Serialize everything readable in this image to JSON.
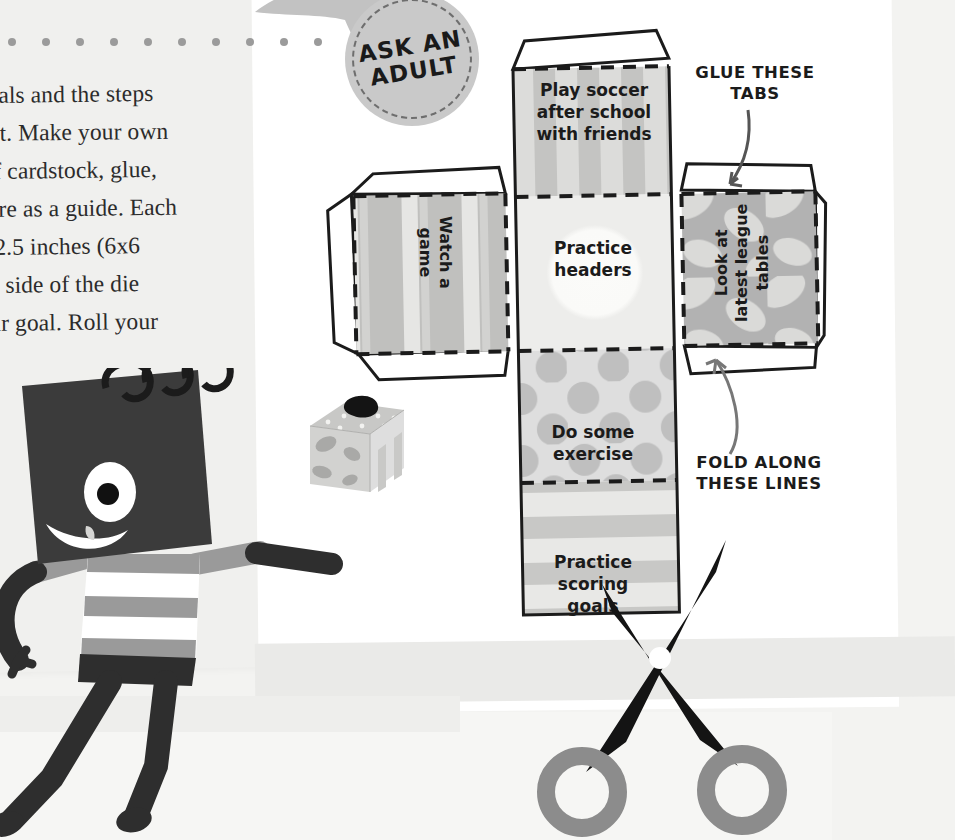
{
  "document": {
    "title": "Make Your Own Goal Die",
    "body_text_lines": [
      "goals and the steps",
      "n it. Make your own",
      " of cardstock, glue,",
      "here as a guide. Each",
      "x 2.5 inches (6x6",
      "ch side of the die",
      "our goal. Roll your"
    ]
  },
  "badge": {
    "line1": "ASK AN",
    "line2": "ADULT",
    "fill_color": "#c9c9c9",
    "dash_color": "#6e6e6e",
    "icon": "winged-badge-icon"
  },
  "callouts": [
    {
      "id": "glue-tabs",
      "line1": "GLUE THESE",
      "line2": "TABS",
      "arrow": "curved-arrow-down-left"
    },
    {
      "id": "fold-lines",
      "line1": "FOLD ALONG",
      "line2": "THESE LINES",
      "arrow": "curved-arrow-up"
    }
  ],
  "cube_net": {
    "fold_line_style": "dashed",
    "cut_line_style": "solid",
    "faces": [
      {
        "id": "top",
        "text": "Play soccer\nafter school\nwith friends",
        "pattern": "vertical-stripes",
        "base_color": "#d8d8d8",
        "accent_color": "#bdbdbd"
      },
      {
        "id": "left",
        "text": "Watch a\ngame",
        "pattern": "vertical-stripes",
        "base_color": "#c2c2c2",
        "accent_color": "#e4e4e2",
        "rotation": 90
      },
      {
        "id": "center",
        "text": "Practice\nheaders",
        "pattern": "center-circle",
        "base_color": "#ececea",
        "accent_color": "#fafaf8"
      },
      {
        "id": "right",
        "text": "Look at\nlatest league\ntables",
        "pattern": "camo-blobs",
        "base_color": "#b4b4b4",
        "accent_color": "#dcdcda",
        "rotation": -90
      },
      {
        "id": "bottom1",
        "text": "Do some\nexercise",
        "pattern": "polka-dots",
        "base_color": "#d7d7d5",
        "accent_color": "#bababa"
      },
      {
        "id": "bottom2",
        "text": "Practice\nscoring\ngoals",
        "pattern": "horizontal-stripes",
        "base_color": "#e0e0de",
        "accent_color": "#c4c4c2"
      }
    ],
    "tab_count": 7
  },
  "illustration": {
    "character": {
      "name": "notebook-head-character",
      "head": "spiral-notebook-head",
      "eye": "single-eye",
      "mouth": "smile-with-tooth",
      "shirt": "striped-shirt",
      "body_color": "#3a3a3a",
      "accent_color": "#9a9a9a"
    },
    "held_object": {
      "name": "assembled-paper-die",
      "faces_visible": 3
    },
    "scissors": {
      "name": "scissors-icon",
      "blade_color": "#1b1b1b",
      "handle_color": "#8c8c8c",
      "pivot_color": "#ffffff"
    }
  },
  "palette": {
    "background": "#f3f3f1",
    "paper_white": "#ffffff",
    "paper_tint": "#f0f0ee",
    "ink": "#1b1b1b",
    "dot_rule": "#9b9b9b"
  }
}
